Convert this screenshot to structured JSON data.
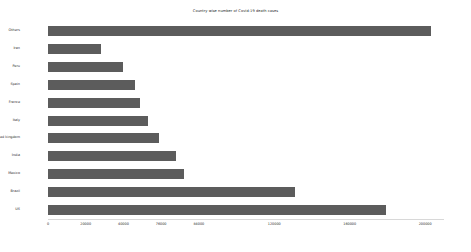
{
  "chart_data": {
    "type": "bar",
    "orientation": "horizontal",
    "title": "Country wise number of Covid-19 death cases",
    "xlabel": "",
    "ylabel": "",
    "categories": [
      "Others",
      "Iran",
      "Peru",
      "Spain",
      "France",
      "Italy",
      "United kingdom",
      "India",
      "Mexico",
      "Brazil",
      "US"
    ],
    "values": [
      203000,
      28000,
      40000,
      46000,
      49000,
      53000,
      59000,
      68000,
      72000,
      131000,
      179000
    ],
    "xlim": [
      0,
      210000
    ],
    "ylim": [
      0,
      11
    ],
    "xticks": [
      0,
      20000,
      40000,
      60000,
      80000,
      120000,
      160000,
      200000
    ],
    "xtick_labels": [
      "0",
      "20000",
      "40000",
      "76000",
      "84000",
      "120000",
      "160000",
      "200000"
    ],
    "grid": false,
    "legend": false,
    "bar_color": "#5c5c5c",
    "background_color": "#ffffff"
  },
  "axis": {
    "tick_0": "0",
    "tick_1": "20000",
    "tick_2": "40000",
    "tick_3": "76000",
    "tick_4": "84000",
    "tick_5": "120000",
    "tick_6": "160000",
    "tick_7": "200000"
  }
}
